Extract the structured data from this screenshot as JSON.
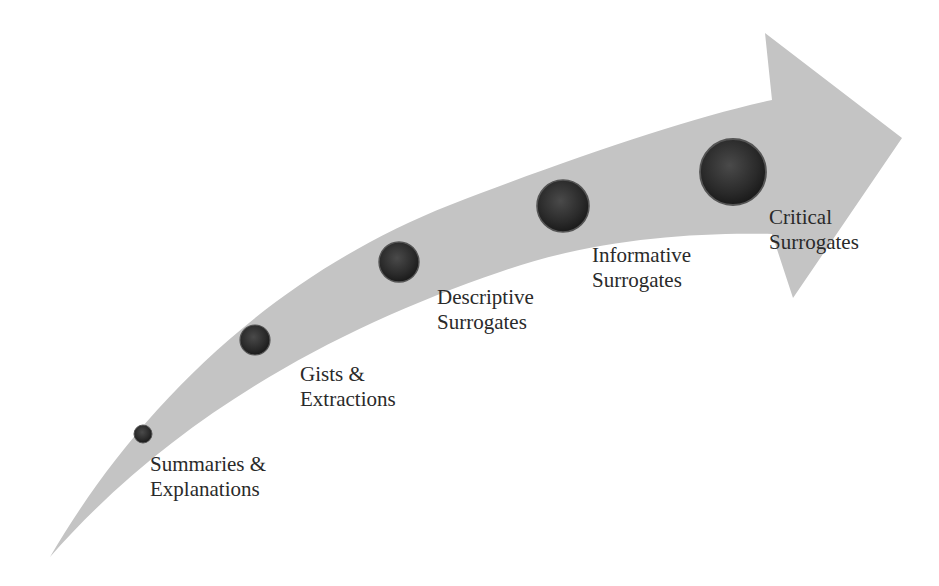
{
  "diagram": {
    "type": "curved-progression-arrow",
    "colors": {
      "arrow_fill": "#c4c4c4",
      "dot_fill": "#2b2b2b",
      "dot_highlight": "#5a5a5a",
      "text": "#2a2a2a",
      "background": "#ffffff"
    },
    "stages": [
      {
        "line1": "Summaries &",
        "line2": "Explanations",
        "order": 1
      },
      {
        "line1": "Gists &",
        "line2": "Extractions",
        "order": 2
      },
      {
        "line1": "Descriptive",
        "line2": "Surrogates",
        "order": 3
      },
      {
        "line1": "Informative",
        "line2": "Surrogates",
        "order": 4
      },
      {
        "line1": "Critical",
        "line2": "Surrogates",
        "order": 5
      }
    ]
  }
}
